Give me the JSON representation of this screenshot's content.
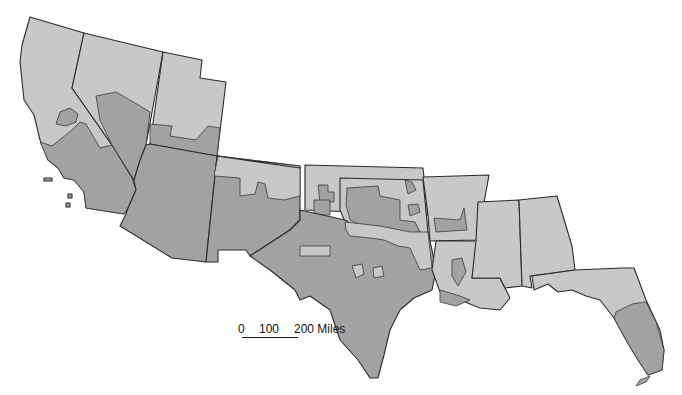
{
  "map": {
    "type": "choropleth",
    "region": "Southern United States",
    "colors": {
      "light": "#c8c8c8",
      "dark": "#a2a2a2",
      "border": "#2b2b2b",
      "background": "#ffffff"
    },
    "states": [
      "California",
      "Nevada",
      "Utah",
      "Arizona",
      "New Mexico",
      "Colorado",
      "Kansas",
      "Oklahoma",
      "Texas",
      "Arkansas",
      "Louisiana",
      "Mississippi",
      "Alabama",
      "Florida"
    ]
  },
  "scale_bar": {
    "label_0": "0",
    "label_100": "100",
    "label_200": "200 Miles"
  }
}
